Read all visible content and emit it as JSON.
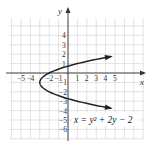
{
  "chart_data": {
    "type": "line",
    "title": "",
    "equation": "x = y² + 2y − 2",
    "xlabel": "x",
    "ylabel": "y",
    "xlim": [
      -6,
      7
    ],
    "ylim": [
      -7,
      5
    ],
    "grid": true,
    "x_ticks": [
      "-5",
      "-4",
      "-2",
      "-1",
      "1",
      "2",
      "3",
      "4",
      "5"
    ],
    "y_ticks": [
      "4",
      "3",
      "2",
      "1",
      "-1",
      "-2",
      "-3",
      "-4",
      "-5",
      "-6"
    ],
    "series": [
      {
        "name": "x = y^2 + 2y - 2",
        "curve": "parabola opening right",
        "vertex": [
          -3,
          -1
        ],
        "x": [
          6,
          1,
          -2,
          -3,
          -2,
          1,
          6
        ],
        "y": [
          2,
          1,
          0,
          -1,
          -2,
          -3,
          -4
        ]
      }
    ],
    "colors": {
      "curve": "#222222",
      "grid": "#cfcfcf",
      "axes": "#333333"
    }
  },
  "labels": {
    "x_axis": "x",
    "y_axis": "y",
    "equation_text": "x = y² + 2y − 2"
  }
}
